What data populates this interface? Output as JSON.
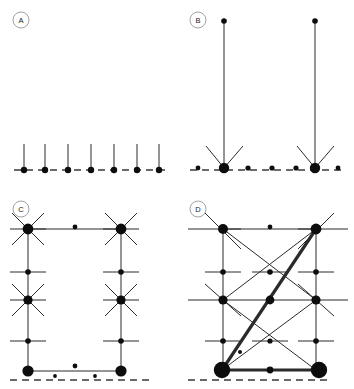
{
  "figure": {
    "background_color": "#ffffff",
    "ink_color": "#0d0d0d",
    "baseline_color": "#3a3a3a",
    "width": 354,
    "height": 389
  },
  "panels": [
    {
      "id": "A",
      "label": "A",
      "label_cx": 21,
      "label_cy": 20,
      "label_r": 8,
      "description": "Seven isolated vertical stems rooted on the dashed baseline",
      "baseline": {
        "x1": 14,
        "x2": 166,
        "y": 170
      },
      "nodes": [
        {
          "name": "a-root-1",
          "cx": 24,
          "cy": 170,
          "r": 3.2
        },
        {
          "name": "a-root-2",
          "cx": 45,
          "cy": 170,
          "r": 3.2
        },
        {
          "name": "a-root-3",
          "cx": 68,
          "cy": 170,
          "r": 3.2
        },
        {
          "name": "a-root-4",
          "cx": 91,
          "cy": 170,
          "r": 3.2
        },
        {
          "name": "a-root-5",
          "cx": 114,
          "cy": 170,
          "r": 3.2
        },
        {
          "name": "a-root-6",
          "cx": 137,
          "cy": 170,
          "r": 3.2
        },
        {
          "name": "a-root-7",
          "cx": 159,
          "cy": 170,
          "r": 3.2
        }
      ],
      "edges": [
        {
          "x1": 24,
          "y1": 170,
          "x2": 24,
          "y2": 144,
          "weight": "thin"
        },
        {
          "x1": 45,
          "y1": 170,
          "x2": 45,
          "y2": 144,
          "weight": "thin"
        },
        {
          "x1": 68,
          "y1": 170,
          "x2": 68,
          "y2": 144,
          "weight": "thin"
        },
        {
          "x1": 91,
          "y1": 170,
          "x2": 91,
          "y2": 144,
          "weight": "thin"
        },
        {
          "x1": 114,
          "y1": 170,
          "x2": 114,
          "y2": 144,
          "weight": "thin"
        },
        {
          "x1": 137,
          "y1": 170,
          "x2": 137,
          "y2": 144,
          "weight": "thin"
        },
        {
          "x1": 159,
          "y1": 170,
          "x2": 159,
          "y2": 144,
          "weight": "thin"
        }
      ]
    },
    {
      "id": "B",
      "label": "B",
      "label_cx": 198,
      "label_cy": 20,
      "label_r": 8,
      "description": "Two tall stems ending in large hub nodes with radiating spokes on the baseline",
      "baseline": {
        "x1": 190,
        "x2": 345,
        "y": 170
      },
      "nodes": [
        {
          "name": "b-small-1",
          "cx": 198,
          "cy": 168,
          "r": 2.4
        },
        {
          "name": "b-hub-left",
          "cx": 224,
          "cy": 168,
          "r": 5.2
        },
        {
          "name": "b-small-2",
          "cx": 248,
          "cy": 168,
          "r": 2.6
        },
        {
          "name": "b-small-3",
          "cx": 272,
          "cy": 168,
          "r": 2.6
        },
        {
          "name": "b-small-4",
          "cx": 296,
          "cy": 168,
          "r": 2.6
        },
        {
          "name": "b-hub-right",
          "cx": 315,
          "cy": 168,
          "r": 5.2
        },
        {
          "name": "b-small-5",
          "cx": 338,
          "cy": 168,
          "r": 2.4
        },
        {
          "name": "b-tip-left",
          "cx": 224,
          "cy": 21,
          "r": 2.8
        },
        {
          "name": "b-tip-right",
          "cx": 315,
          "cy": 21,
          "r": 2.8
        }
      ],
      "edges": [
        {
          "x1": 224,
          "y1": 168,
          "x2": 224,
          "y2": 21,
          "weight": "thin"
        },
        {
          "x1": 315,
          "y1": 168,
          "x2": 315,
          "y2": 21,
          "weight": "thin"
        },
        {
          "x1": 224,
          "y1": 168,
          "x2": 206,
          "y2": 146,
          "weight": "thin"
        },
        {
          "x1": 224,
          "y1": 168,
          "x2": 243,
          "y2": 146,
          "weight": "thin"
        },
        {
          "x1": 315,
          "y1": 168,
          "x2": 297,
          "y2": 146,
          "weight": "thin"
        },
        {
          "x1": 315,
          "y1": 168,
          "x2": 334,
          "y2": 146,
          "weight": "thin"
        }
      ]
    },
    {
      "id": "C",
      "label": "C",
      "label_cx": 21,
      "label_cy": 209,
      "label_r": 8,
      "description": "Rectangular ladder lattice with six-spoke hubs at corners and mid-rail cross nodes",
      "baseline": {
        "x1": 10,
        "x2": 150,
        "y": 380
      },
      "nodes": [
        {
          "name": "c-hub-top-left",
          "cx": 28,
          "cy": 229,
          "r": 5.4
        },
        {
          "name": "c-hub-top-right",
          "cx": 121,
          "cy": 229,
          "r": 5.4
        },
        {
          "name": "c-mid-top-dot",
          "cx": 75,
          "cy": 227,
          "r": 2.4
        },
        {
          "name": "c-node-left-upper",
          "cx": 28,
          "cy": 272,
          "r": 2.8
        },
        {
          "name": "c-node-right-upper",
          "cx": 121,
          "cy": 272,
          "r": 2.8
        },
        {
          "name": "c-hub-left-mid",
          "cx": 28,
          "cy": 300,
          "r": 4.6
        },
        {
          "name": "c-hub-right-mid",
          "cx": 121,
          "cy": 300,
          "r": 4.6
        },
        {
          "name": "c-node-left-lower",
          "cx": 28,
          "cy": 341,
          "r": 2.8
        },
        {
          "name": "c-node-right-lower",
          "cx": 121,
          "cy": 341,
          "r": 2.8
        },
        {
          "name": "c-hub-bot-left",
          "cx": 28,
          "cy": 371,
          "r": 5.6
        },
        {
          "name": "c-hub-bot-right",
          "cx": 121,
          "cy": 371,
          "r": 5.6
        },
        {
          "name": "c-loose-dot-1",
          "cx": 75,
          "cy": 366,
          "r": 2.4
        },
        {
          "name": "c-loose-dot-2",
          "cx": 55,
          "cy": 376,
          "r": 1.9
        },
        {
          "name": "c-loose-dot-3",
          "cx": 95,
          "cy": 376,
          "r": 1.9
        }
      ],
      "edges": [
        {
          "x1": 28,
          "y1": 229,
          "x2": 121,
          "y2": 229,
          "weight": "thin"
        },
        {
          "x1": 28,
          "y1": 371,
          "x2": 121,
          "y2": 371,
          "weight": "thin"
        },
        {
          "x1": 28,
          "y1": 229,
          "x2": 28,
          "y2": 371,
          "weight": "thin"
        },
        {
          "x1": 121,
          "y1": 229,
          "x2": 121,
          "y2": 371,
          "weight": "thin"
        },
        {
          "x1": 12,
          "y1": 213,
          "x2": 44,
          "y2": 245,
          "weight": "thin"
        },
        {
          "x1": 44,
          "y1": 213,
          "x2": 12,
          "y2": 245,
          "weight": "thin"
        },
        {
          "x1": 105,
          "y1": 213,
          "x2": 137,
          "y2": 245,
          "weight": "thin"
        },
        {
          "x1": 137,
          "y1": 213,
          "x2": 105,
          "y2": 245,
          "weight": "thin"
        },
        {
          "x1": 12,
          "y1": 284,
          "x2": 44,
          "y2": 316,
          "weight": "thin"
        },
        {
          "x1": 44,
          "y1": 284,
          "x2": 12,
          "y2": 316,
          "weight": "thin"
        },
        {
          "x1": 105,
          "y1": 284,
          "x2": 137,
          "y2": 316,
          "weight": "thin"
        },
        {
          "x1": 137,
          "y1": 284,
          "x2": 105,
          "y2": 316,
          "weight": "thin"
        },
        {
          "x1": 10,
          "y1": 229,
          "x2": 46,
          "y2": 229,
          "weight": "thin"
        },
        {
          "x1": 103,
          "y1": 229,
          "x2": 139,
          "y2": 229,
          "weight": "thin"
        },
        {
          "x1": 10,
          "y1": 272,
          "x2": 46,
          "y2": 272,
          "weight": "thin"
        },
        {
          "x1": 103,
          "y1": 272,
          "x2": 139,
          "y2": 272,
          "weight": "thin"
        },
        {
          "x1": 10,
          "y1": 300,
          "x2": 46,
          "y2": 300,
          "weight": "thin"
        },
        {
          "x1": 103,
          "y1": 300,
          "x2": 139,
          "y2": 300,
          "weight": "thin"
        },
        {
          "x1": 10,
          "y1": 341,
          "x2": 46,
          "y2": 341,
          "weight": "thin"
        },
        {
          "x1": 103,
          "y1": 341,
          "x2": 139,
          "y2": 341,
          "weight": "thin"
        }
      ]
    },
    {
      "id": "D",
      "label": "D",
      "label_cx": 198,
      "label_cy": 209,
      "label_r": 8,
      "description": "Dense lattice with crossing diagonals and a bold highlighted path from the bottom-left hub to the top-right hub",
      "baseline": {
        "x1": 188,
        "x2": 330,
        "y": 380
      },
      "nodes": [
        {
          "name": "d-hub-top-left",
          "cx": 223,
          "cy": 229,
          "r": 5.0
        },
        {
          "name": "d-hub-top-right",
          "cx": 316,
          "cy": 229,
          "r": 5.4
        },
        {
          "name": "d-mid-top-dot",
          "cx": 270,
          "cy": 227,
          "r": 2.4
        },
        {
          "name": "d-node-left-upper",
          "cx": 223,
          "cy": 272,
          "r": 2.8
        },
        {
          "name": "d-node-center-up",
          "cx": 270,
          "cy": 272,
          "r": 2.8
        },
        {
          "name": "d-node-right-upper",
          "cx": 316,
          "cy": 272,
          "r": 2.8
        },
        {
          "name": "d-hub-left-mid",
          "cx": 223,
          "cy": 300,
          "r": 4.6
        },
        {
          "name": "d-hub-center-mid",
          "cx": 270,
          "cy": 300,
          "r": 4.4
        },
        {
          "name": "d-hub-right-mid",
          "cx": 316,
          "cy": 300,
          "r": 4.6
        },
        {
          "name": "d-node-left-lower",
          "cx": 223,
          "cy": 341,
          "r": 2.8
        },
        {
          "name": "d-node-center-low",
          "cx": 270,
          "cy": 341,
          "r": 2.6
        },
        {
          "name": "d-node-right-lower",
          "cx": 316,
          "cy": 341,
          "r": 2.8
        },
        {
          "name": "d-loose-dot",
          "cx": 240,
          "cy": 352,
          "r": 2.0
        },
        {
          "name": "d-hub-bot-left",
          "cx": 222,
          "cy": 370,
          "r": 8.2
        },
        {
          "name": "d-hub-bot-right",
          "cx": 319,
          "cy": 370,
          "r": 8.2
        },
        {
          "name": "d-mid-bot-dot",
          "cx": 270,
          "cy": 370,
          "r": 3.4
        }
      ],
      "edges": [
        {
          "x1": 223,
          "y1": 229,
          "x2": 316,
          "y2": 229,
          "weight": "thin"
        },
        {
          "x1": 223,
          "y1": 229,
          "x2": 223,
          "y2": 370,
          "weight": "thin"
        },
        {
          "x1": 316,
          "y1": 229,
          "x2": 316,
          "y2": 370,
          "weight": "thin"
        },
        {
          "x1": 205,
          "y1": 213,
          "x2": 241,
          "y2": 249,
          "weight": "thin"
        },
        {
          "x1": 298,
          "y1": 249,
          "x2": 334,
          "y2": 213,
          "weight": "thin"
        },
        {
          "x1": 223,
          "y1": 229,
          "x2": 316,
          "y2": 300,
          "weight": "thin"
        },
        {
          "x1": 316,
          "y1": 229,
          "x2": 223,
          "y2": 300,
          "weight": "thin"
        },
        {
          "x1": 223,
          "y1": 300,
          "x2": 316,
          "y2": 370,
          "weight": "thin"
        },
        {
          "x1": 316,
          "y1": 300,
          "x2": 222,
          "y2": 370,
          "weight": "thin"
        },
        {
          "x1": 205,
          "y1": 284,
          "x2": 241,
          "y2": 316,
          "weight": "thin"
        },
        {
          "x1": 298,
          "y1": 284,
          "x2": 334,
          "y2": 316,
          "weight": "thin"
        },
        {
          "x1": 188,
          "y1": 229,
          "x2": 241,
          "y2": 229,
          "weight": "thin"
        },
        {
          "x1": 298,
          "y1": 229,
          "x2": 348,
          "y2": 229,
          "weight": "thin"
        },
        {
          "x1": 205,
          "y1": 272,
          "x2": 241,
          "y2": 272,
          "weight": "thin"
        },
        {
          "x1": 252,
          "y1": 272,
          "x2": 288,
          "y2": 272,
          "weight": "thin"
        },
        {
          "x1": 298,
          "y1": 272,
          "x2": 334,
          "y2": 272,
          "weight": "thin"
        },
        {
          "x1": 188,
          "y1": 300,
          "x2": 348,
          "y2": 300,
          "weight": "thin"
        },
        {
          "x1": 205,
          "y1": 341,
          "x2": 241,
          "y2": 341,
          "weight": "thin"
        },
        {
          "x1": 252,
          "y1": 341,
          "x2": 288,
          "y2": 341,
          "weight": "thin"
        },
        {
          "x1": 298,
          "y1": 341,
          "x2": 334,
          "y2": 341,
          "weight": "thin"
        }
      ],
      "bold_edges": [
        {
          "name": "d-bold-diagonal",
          "x1": 222,
          "y1": 370,
          "x2": 316,
          "y2": 229
        },
        {
          "name": "d-bold-base",
          "x1": 222,
          "y1": 370,
          "x2": 319,
          "y2": 370
        }
      ]
    }
  ]
}
